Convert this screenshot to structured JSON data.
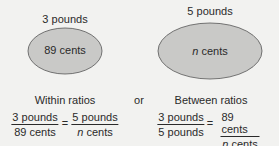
{
  "colors": {
    "background": "#f2f2f0",
    "ellipse_fill": "#c9c9c7",
    "ellipse_stroke": "#555555",
    "text": "#2a2a2a"
  },
  "left_set": {
    "top_label": "3 pounds",
    "inner_value": "89",
    "inner_unit": "cents"
  },
  "right_set": {
    "top_label": "5 pounds",
    "inner_var": "n",
    "inner_unit": "cents"
  },
  "within": {
    "heading": "Within ratios",
    "left_num": "3 pounds",
    "left_den": "89 cents",
    "equals": "=",
    "right_num": "5 pounds",
    "right_den_var": "n",
    "right_den_unit": "cents"
  },
  "connector": "or",
  "between": {
    "heading": "Between ratios",
    "left_num": "3 pounds",
    "left_den": "5 pounds",
    "equals": "=",
    "right_num": "89 cents",
    "right_den_var": "n",
    "right_den_unit": "cents"
  }
}
